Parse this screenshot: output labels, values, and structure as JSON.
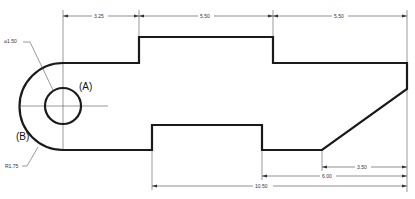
{
  "drawing": {
    "type": "technical-drawing",
    "callouts": {
      "hole_diameter": "⌀1.50",
      "arc_radius": "R1.75",
      "hole_label": "(A)",
      "arc_label": "(B)"
    },
    "top_dimensions": [
      {
        "label": "3.25"
      },
      {
        "label": "5.50"
      },
      {
        "label": "5.50"
      }
    ],
    "bottom_dimensions": [
      {
        "label": "3.50"
      },
      {
        "label": "6.00"
      },
      {
        "label": "10.50"
      }
    ],
    "colors": {
      "outline": "#1a1a1a",
      "dimension": "#444444",
      "background": "#ffffff"
    }
  }
}
